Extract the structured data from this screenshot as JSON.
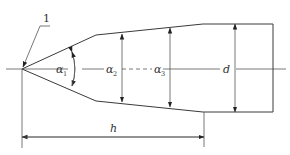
{
  "diagram": {
    "type": "technical drawing",
    "callout": {
      "label": "1"
    },
    "labels": {
      "alpha1": {
        "symbol": "α",
        "subscript": "1"
      },
      "alpha2": {
        "symbol": "α",
        "subscript": "2"
      },
      "alpha3": {
        "symbol": "α",
        "subscript": "3"
      },
      "diameter": "d",
      "length": "h"
    },
    "colors": {
      "line": "#3a3a3a",
      "text": "#333333",
      "background": "#ffffff"
    }
  }
}
